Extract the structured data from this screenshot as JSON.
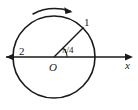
{
  "figure": {
    "type": "geometry-diagram",
    "stroke_color": "#1a1a1a",
    "background_color": "#ffffff"
  },
  "geometry": {
    "circle": {
      "center_x": 54,
      "center_y": 57,
      "radius": 41
    },
    "axis": {
      "y": 57,
      "x_start": 6,
      "x_end": 133
    },
    "radius_line": {
      "angle_degrees": 45,
      "from_x": 54,
      "from_y": 57,
      "to_x": 83,
      "to_y": 28
    },
    "angle_arc": {
      "radius": 13,
      "start_degrees": 0,
      "end_degrees": 45
    },
    "direction_arc": {
      "label": "counterclockwise-indicator",
      "center_x": 54,
      "center_y": 57,
      "radius": 48
    }
  },
  "labels": {
    "point_1": "1",
    "point_2": "2",
    "origin": "O",
    "angle": "π/4",
    "axis_x": "x"
  },
  "icons": {
    "arrow_left": "arrow-left-icon",
    "arrow_right": "arrow-right-icon",
    "arrow_arc": "rotation-arrow-icon"
  }
}
